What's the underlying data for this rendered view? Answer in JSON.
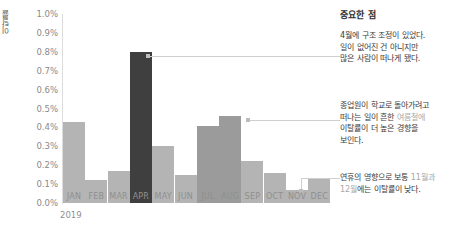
{
  "chart_data": {
    "type": "bar",
    "title": "",
    "xlabel": "2019",
    "ylabel": "이탈률",
    "categories": [
      "JAN",
      "FEB",
      "MAR",
      "APR",
      "MAY",
      "JUN",
      "JUL",
      "AUG",
      "SEP",
      "OCT",
      "NOV",
      "DEC"
    ],
    "values": [
      0.43,
      0.12,
      0.17,
      0.8,
      0.3,
      0.15,
      0.41,
      0.46,
      0.22,
      0.16,
      0.07,
      0.13
    ],
    "value_unit": "%",
    "ylim": [
      0.0,
      1.0
    ],
    "ytick_labels": [
      "1.0%",
      "0.9%",
      "0.8%",
      "0.7%",
      "0.6%",
      "0.5%",
      "0.4%",
      "0.3%",
      "0.2%",
      "0.1%",
      "0.0%"
    ],
    "ytick_values": [
      1.0,
      0.9,
      0.8,
      0.7,
      0.6,
      0.5,
      0.4,
      0.3,
      0.2,
      0.1,
      0.0
    ],
    "grid": false,
    "legend": "none",
    "bar_emphasis": {
      "dark": [
        "APR"
      ],
      "mid": [
        "JUL",
        "AUG"
      ],
      "light": [
        "JAN",
        "FEB",
        "MAR",
        "MAY",
        "JUN",
        "SEP",
        "OCT",
        "NOV",
        "DEC"
      ]
    },
    "colors": {
      "bar_light": "#b4b4b4",
      "bar_mid": "#9b9b9b",
      "bar_dark": "#3f3f3f",
      "leader_line": "#cfcfcf",
      "axis": "#dcdcdc",
      "tick_text": "#8a8a8a",
      "note_text": "#3a3a3a",
      "note_highlight": "#a8a8a8"
    },
    "annotations": [
      {
        "target": "APR",
        "text": "4월에 구조 조정이 있었다. 일이 없어진 건 아니지만 많은 사람이 떠나게 됐다."
      },
      {
        "target": "AUG",
        "text": "종업원이 학교로 돌아가려고 떠나는 일이 흔한 여름철에 이탈률이 더 높은 경향을 보인다."
      },
      {
        "target": "NOV",
        "text": "연휴의 영향으로 보통 11월과 12월에는 이탈률이 낮다."
      }
    ]
  },
  "notes": {
    "title": "중요한 점",
    "items": [
      {
        "lines": [
          "4월에 구조 조정이 있었다.",
          "일이 없어진 건 아니지만",
          "많은 사람이 떠나게 됐다."
        ]
      },
      {
        "line1_a": "종업원이 학교로 돌아가려고",
        "line2_a": "떠나는 일이 흔한 ",
        "line2_hl": "여름철에",
        "line3_a": "이탈률이 더 높은 경향을",
        "line4_a": "보인다."
      },
      {
        "line1_a": "연휴의 영향으로 보통 ",
        "line1_hl": "11월과",
        "line2_hl": "12월",
        "line2_a": "에는 이탈률이 낮다."
      }
    ]
  }
}
